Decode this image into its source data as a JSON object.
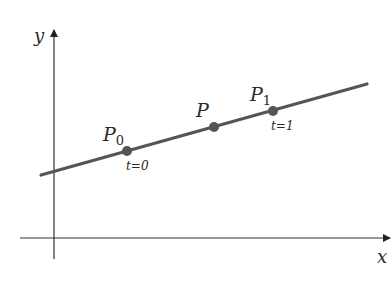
{
  "diagram": {
    "axes": {
      "x_label": "x",
      "y_label": "y",
      "axis_color": "#333333"
    },
    "line": {
      "color": "#555555",
      "start": [
        41,
        175
      ],
      "end": [
        367,
        84
      ]
    },
    "points": [
      {
        "name": "P",
        "subscript": "0",
        "param_label": "t=0",
        "x": 127,
        "y": 151
      },
      {
        "name": "P",
        "subscript": "",
        "param_label": "",
        "x": 214,
        "y": 127
      },
      {
        "name": "P",
        "subscript": "1",
        "param_label": "t=1",
        "x": 273,
        "y": 111
      }
    ],
    "point_color": "#555555"
  }
}
